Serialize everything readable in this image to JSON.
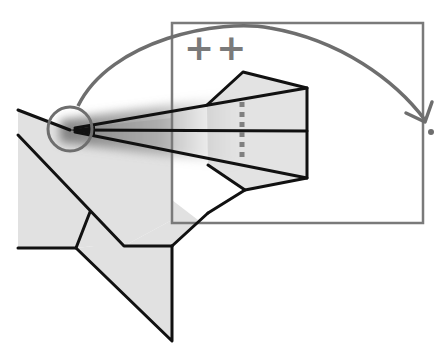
{
  "diagram": {
    "title": "",
    "type": "fold-instruction",
    "canvas": {
      "width": 446,
      "height": 355,
      "background": "#ffffff"
    },
    "colors": {
      "paper_fill": "#e1e1e1",
      "fold_line": "#111111",
      "guide_gray": "#7a7a7a",
      "shadow": "#8a8a8a"
    },
    "annotations": {
      "marks_label": "++"
    },
    "elements": [
      {
        "name": "paper-shape",
        "description": "gray folded paper shape"
      },
      {
        "name": "pivot-circle",
        "description": "circle marking the pivot point"
      },
      {
        "name": "rotation-arc-arrow",
        "description": "curved arrow showing rotation direction"
      },
      {
        "name": "zoom-frame",
        "description": "gray rectangle framing the folded nose"
      },
      {
        "name": "valley-fold-dotted-line",
        "description": "vertical dotted fold guide"
      },
      {
        "name": "target-dot",
        "description": "small dot at arrow destination"
      }
    ]
  }
}
